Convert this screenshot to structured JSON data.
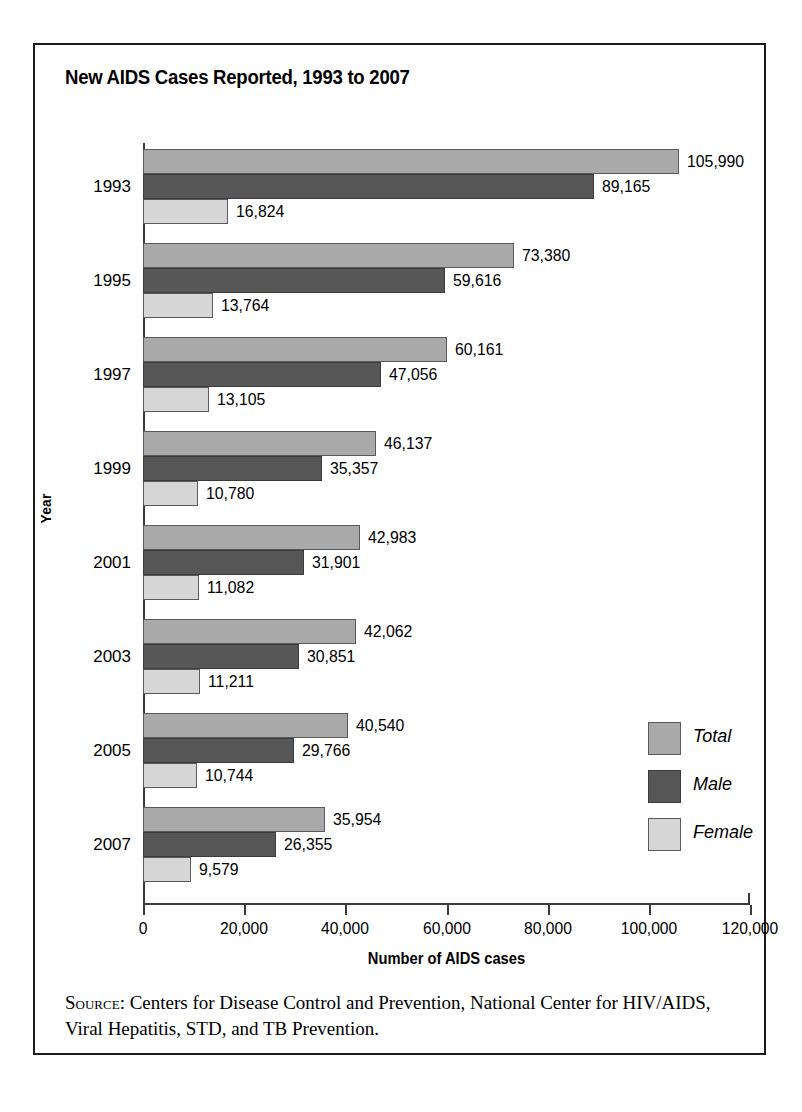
{
  "chart_data": {
    "type": "bar",
    "orientation": "horizontal",
    "title": "New AIDS Cases Reported, 1993 to 2007",
    "xlabel": "Number of AIDS cases",
    "ylabel": "Year",
    "xlim": [
      0,
      120000
    ],
    "xticks": [
      "0",
      "20,000",
      "40,000",
      "60,000",
      "80,000",
      "100,000",
      "120,000"
    ],
    "xtick_values": [
      0,
      20000,
      40000,
      60000,
      80000,
      100000,
      120000
    ],
    "grid": false,
    "legend_position": "right-lower",
    "categories": [
      "1993",
      "1995",
      "1997",
      "1999",
      "2001",
      "2003",
      "2005",
      "2007"
    ],
    "series": [
      {
        "name": "Total",
        "color": "#a9a9a9",
        "values": [
          105990,
          73380,
          60161,
          46137,
          42983,
          42062,
          40540,
          35954
        ],
        "labels": [
          "105,990",
          "73,380",
          "60,161",
          "46,137",
          "42,983",
          "42,062",
          "40,540",
          "35,954"
        ]
      },
      {
        "name": "Male",
        "color": "#575757",
        "values": [
          89165,
          59616,
          47056,
          35357,
          31901,
          30851,
          29766,
          26355
        ],
        "labels": [
          "89,165",
          "59,616",
          "47,056",
          "35,357",
          "31,901",
          "30,851",
          "29,766",
          "26,355"
        ]
      },
      {
        "name": "Female",
        "color": "#d6d6d6",
        "values": [
          16824,
          13764,
          13105,
          10780,
          11082,
          11211,
          10744,
          9579
        ],
        "labels": [
          "16,824",
          "13,764",
          "13,105",
          "10,780",
          "11,082",
          "11,211",
          "10,744",
          "9,579"
        ]
      }
    ]
  },
  "legend": {
    "items": [
      {
        "label": "Total",
        "key": "total"
      },
      {
        "label": "Male",
        "key": "male"
      },
      {
        "label": "Female",
        "key": "female"
      }
    ]
  },
  "source": {
    "label": "Source:",
    "text": " Centers for Disease Control and Prevention, National Center for HIV/AIDS, Viral Hepatitis, STD, and TB Prevention."
  },
  "colors": {
    "total": "#a9a9a9",
    "male": "#575757",
    "female": "#d6d6d6",
    "axis": "#3a3a3a",
    "border": "#1a1a1a"
  }
}
